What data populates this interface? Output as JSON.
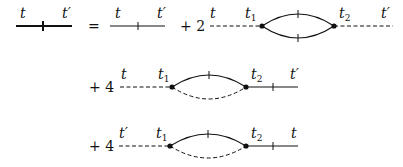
{
  "diagram": {
    "lhs": {
      "line_style": "thick solid with tick",
      "left_label": "t",
      "right_label": "t′"
    },
    "equals": "=",
    "terms": [
      {
        "coefficient": "",
        "type": "free propagator",
        "left_label": "t",
        "right_label": "t′"
      },
      {
        "coefficient": "+ 2",
        "type": "bubble",
        "left_label": "t",
        "vertex1_label": "t",
        "vertex1_sub": "1",
        "vertex2_label": "t",
        "vertex2_sub": "2",
        "right_label": "t′",
        "left_leg": "dashed",
        "right_leg": "dashed",
        "top_arc": "solid with tick",
        "bottom_arc": "solid with tick"
      },
      {
        "coefficient": "+ 4",
        "type": "bubble",
        "left_label": "t",
        "vertex1_label": "t",
        "vertex1_sub": "1",
        "vertex2_label": "t",
        "vertex2_sub": "2",
        "right_label": "t′",
        "left_leg": "dashed",
        "right_leg": "solid with tick",
        "top_arc": "solid with tick",
        "bottom_arc": "dashed"
      },
      {
        "coefficient": "+ 4",
        "type": "bubble",
        "left_label": "t′",
        "vertex1_label": "t",
        "vertex1_sub": "1",
        "vertex2_label": "t",
        "vertex2_sub": "2",
        "right_label": "t",
        "left_leg": "dashed",
        "right_leg": "solid with tick",
        "top_arc": "solid with tick",
        "bottom_arc": "dashed"
      }
    ]
  }
}
